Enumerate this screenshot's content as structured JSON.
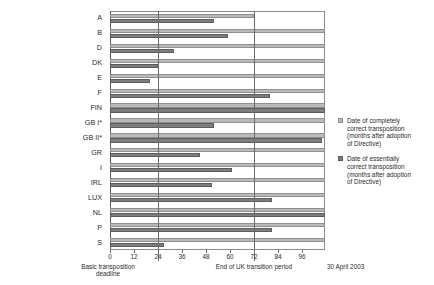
{
  "chart_data": {
    "type": "bar",
    "orientation": "horizontal",
    "title": "",
    "xlabel": "",
    "ylabel": "",
    "xlim": [
      0,
      107.5
    ],
    "xticks": [
      0,
      12,
      24,
      36,
      48,
      60,
      72,
      84,
      96
    ],
    "xtick_labels": [
      "0",
      "12",
      "24",
      "36",
      "48",
      "60",
      "72",
      "84",
      "96"
    ],
    "grid": false,
    "legend_position": "right",
    "categories": [
      "A",
      "B",
      "D",
      "DK",
      "E",
      "F",
      "FIN",
      "GB I*",
      "GB II*",
      "GR",
      "I",
      "IRL",
      "LUX",
      "NL",
      "P",
      "S"
    ],
    "series": [
      {
        "name": "Date of completely correct transposition (months after adoption of Directive)",
        "color": "#b9b9b9",
        "values": [
          72,
          107.5,
          107.5,
          107.5,
          107.5,
          107.5,
          107.5,
          107.5,
          107.5,
          107.5,
          107.5,
          107.5,
          107.5,
          107.5,
          107.5,
          107.5
        ]
      },
      {
        "name": "Date of essentially correct transposition (months after adoption of Directive)",
        "color": "#7d7d7d",
        "values": [
          52,
          59,
          32,
          24,
          20,
          80,
          107.5,
          52,
          106,
          45,
          61,
          51,
          81,
          107.5,
          81,
          27
        ]
      }
    ],
    "reference_lines": [
      {
        "x": 24,
        "label": "Basic transposition\ndeadline"
      },
      {
        "x": 72,
        "label": "End of UK transition period"
      }
    ],
    "right_edge_label": "30 April 2003"
  },
  "legend": {
    "entries": [
      {
        "swatch": "light-gray",
        "label": "Date of completely\ncorrect transposition\n(months after adoption\nof Directive)"
      },
      {
        "swatch": "dark-gray",
        "label": "Date of essentially\ncorrect transposition\n(months after adoption\nof Directive)"
      }
    ]
  },
  "annotations": {
    "basic_deadline": "Basic transposition\ndeadline",
    "uk_transition": "End of UK transition period",
    "end_date": "30 April 2003"
  },
  "colors": {
    "series_complete": "#b9b9b9",
    "series_essential": "#7d7d7d",
    "axis": "#6b6b6b",
    "text": "#2b2b2b"
  }
}
